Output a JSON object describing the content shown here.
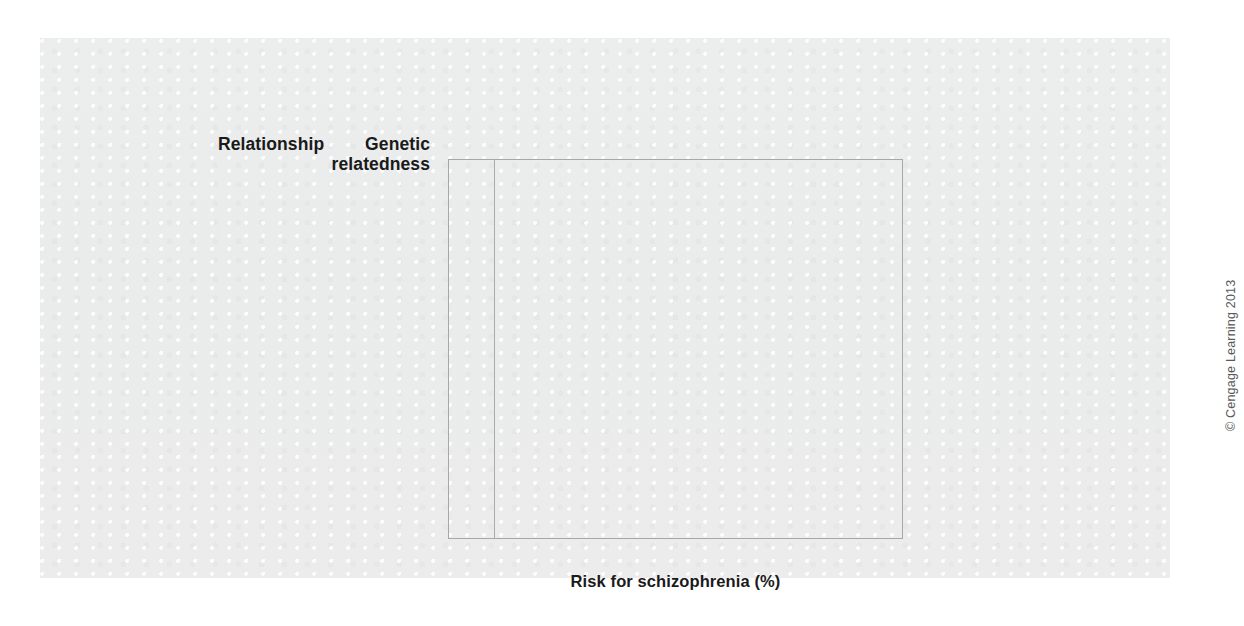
{
  "figure": {
    "headers": {
      "relationship": "Relationship",
      "genetic_relatedness": "Genetic\nrelatedness"
    },
    "x_axis_title": "Risk for schizophrenia (%)",
    "x_tick_labels": [
      "1",
      "2",
      "3",
      "4",
      "5",
      "6",
      "7",
      "8",
      "9",
      "10"
    ],
    "copyright": "© Cengage Learning 2013",
    "colors": {
      "page_background": "#ffffff",
      "panel_background": "#ebecec",
      "bar_fill": "#232323",
      "bar_highlight": "#919393",
      "gridline": "#a9abab",
      "text": "#26282a",
      "heading_text": "#1a1a1a",
      "copyright_text": "#58595b"
    }
  },
  "chart_data": {
    "type": "bar",
    "orientation": "horizontal",
    "title": "",
    "subtitle": "",
    "xlabel": "Risk for schizophrenia (%)",
    "ylabel": "",
    "xlim": [
      0,
      10
    ],
    "xticks": [
      1,
      2,
      3,
      4,
      5,
      6,
      7,
      8,
      9,
      10
    ],
    "grid": "vertical",
    "legend": "none",
    "categories": [
      "First-degree\nrelatives\n(siblings)",
      "Second-degree\nrelatives\n(nieces/nephews)",
      "Third-degree\nrelatives\n(first cousins)",
      "Unrelated people\nin general\npopulation"
    ],
    "series": [
      {
        "name": "Risk for schizophrenia (%)",
        "values": [
          9.2,
          4.0,
          2.1,
          1.1
        ]
      }
    ],
    "annotations": {
      "genetic_relatedness": [
        "50%",
        "25%",
        "12.5%",
        "0%"
      ]
    },
    "rows": [
      {
        "relationship": "First-degree\nrelatives\n(siblings)",
        "genetic_relatedness": "50%",
        "risk_percent": 9.2
      },
      {
        "relationship": "Second-degree\nrelatives\n(nieces/nephews)",
        "genetic_relatedness": "25%",
        "risk_percent": 4.0
      },
      {
        "relationship": "Third-degree\nrelatives\n(first cousins)",
        "genetic_relatedness": "12.5%",
        "risk_percent": 2.1
      },
      {
        "relationship": "Unrelated people\nin general\npopulation",
        "genetic_relatedness": "0%",
        "risk_percent": 1.1
      }
    ]
  }
}
